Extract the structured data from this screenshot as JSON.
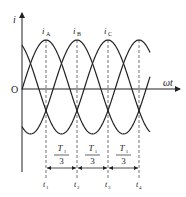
{
  "axes": {
    "y_label": "i",
    "x_label": "ωt",
    "origin_label": "O"
  },
  "curves": [
    {
      "name": "i_A",
      "label_main": "i",
      "label_sub": "A",
      "peak_x": 46
    },
    {
      "name": "i_B",
      "label_main": "i",
      "label_sub": "B",
      "peak_x": 77
    },
    {
      "name": "i_C",
      "label_main": "i",
      "label_sub": "C",
      "peak_x": 108
    }
  ],
  "intervals": [
    {
      "numerator": "T",
      "num_sub": "1",
      "denominator": "3"
    },
    {
      "numerator": "T",
      "num_sub": "1",
      "denominator": "3"
    },
    {
      "numerator": "T",
      "num_sub": "1",
      "denominator": "3"
    }
  ],
  "time_marks": [
    {
      "main": "t",
      "sub": "1"
    },
    {
      "main": "t",
      "sub": "2"
    },
    {
      "main": "t",
      "sub": "3"
    },
    {
      "main": "t",
      "sub": "4"
    }
  ],
  "colors": {
    "stroke": "#222222",
    "dash": "#333333"
  }
}
